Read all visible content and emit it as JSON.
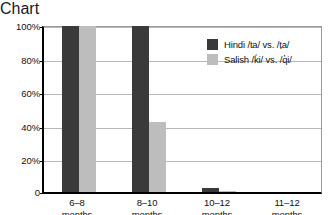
{
  "chart_data": {
    "type": "bar",
    "title": "",
    "subtitle": "",
    "xlabel": "",
    "ylabel": "",
    "categories": [
      "6–8\nmonths",
      "8–10\nmonths",
      "10–12\nmonths",
      "11–12\nmonths"
    ],
    "category_lines": [
      [
        "6–8",
        "months"
      ],
      [
        "8–10",
        "months"
      ],
      [
        "10–12",
        "months"
      ],
      [
        "11–12",
        "months"
      ]
    ],
    "series": [
      {
        "name": "Hindi /ta/ vs. /ṭa/",
        "color": "#3a3a3a",
        "values": [
          100,
          100,
          2.5,
          0
        ]
      },
      {
        "name": "Salish /ḱi/ vs. /q̓i/",
        "color": "#bdbdbd",
        "values": [
          100,
          42,
          0.5,
          0
        ]
      }
    ],
    "ylim": [
      0,
      100
    ],
    "yticks": [
      0,
      20,
      40,
      60,
      80,
      100
    ],
    "ytick_labels": [
      "0",
      "20%",
      "40%",
      "60%",
      "80%",
      "100%"
    ],
    "grid": true,
    "grid_axis": "y",
    "legend_position": "upper right",
    "legend_frame": false
  },
  "legend": {
    "entries": [
      {
        "label": "Hindi /ta/ vs. /ṭa/",
        "swatch": "dark-swatch"
      },
      {
        "label": "Salish /ḱi/ vs. /q̓i/",
        "swatch": "light-swatch"
      }
    ]
  }
}
